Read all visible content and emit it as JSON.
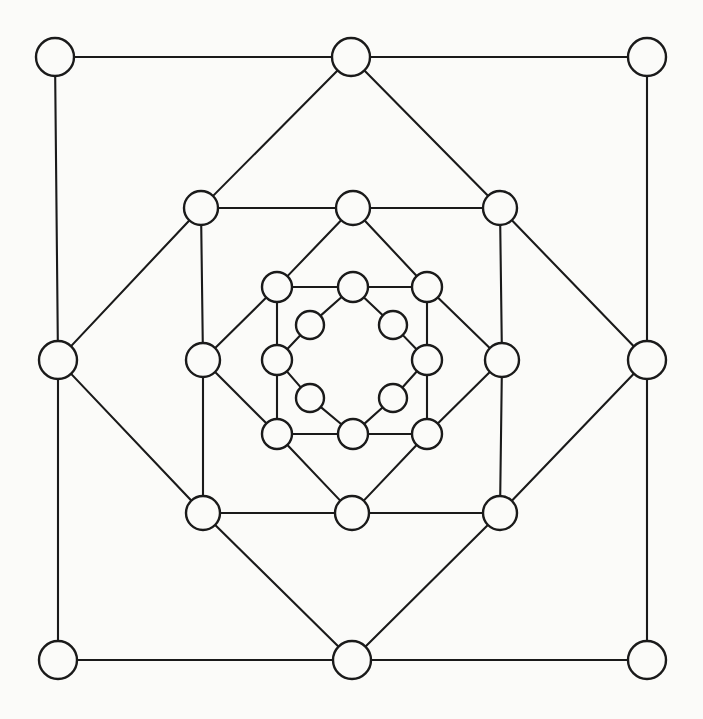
{
  "figure": {
    "kind": "node-link-diagram",
    "background_color": "#fbfbf9",
    "node_fill_color": "#fbfbf9",
    "node_stroke_color": "#1a1a1a",
    "edge_color": "#1a1a1a",
    "node_stroke_width": 2.4,
    "edge_stroke_width": 2.1,
    "node_count": 28,
    "edge_count": 48,
    "ring_count": 4,
    "width": 703,
    "height": 719
  },
  "chart_data": {
    "type": "graph",
    "xlabel": "",
    "ylabel": "",
    "nodes": [
      {
        "id": "r1-nw",
        "ring": 1,
        "role": "corner",
        "x": 55,
        "y": 57,
        "r": 19
      },
      {
        "id": "r1-n",
        "ring": 1,
        "role": "mid",
        "x": 351,
        "y": 57,
        "r": 19
      },
      {
        "id": "r1-ne",
        "ring": 1,
        "role": "corner",
        "x": 647,
        "y": 57,
        "r": 19
      },
      {
        "id": "r1-e",
        "ring": 1,
        "role": "mid",
        "x": 647,
        "y": 360,
        "r": 19
      },
      {
        "id": "r1-se",
        "ring": 1,
        "role": "corner",
        "x": 647,
        "y": 660,
        "r": 19
      },
      {
        "id": "r1-s",
        "ring": 1,
        "role": "mid",
        "x": 352,
        "y": 660,
        "r": 19
      },
      {
        "id": "r1-sw",
        "ring": 1,
        "role": "corner",
        "x": 58,
        "y": 660,
        "r": 19
      },
      {
        "id": "r1-w",
        "ring": 1,
        "role": "mid",
        "x": 58,
        "y": 360,
        "r": 19
      },
      {
        "id": "r2-nw",
        "ring": 2,
        "role": "corner",
        "x": 201,
        "y": 208,
        "r": 17
      },
      {
        "id": "r2-n",
        "ring": 2,
        "role": "mid",
        "x": 353,
        "y": 208,
        "r": 17
      },
      {
        "id": "r2-ne",
        "ring": 2,
        "role": "corner",
        "x": 500,
        "y": 208,
        "r": 17
      },
      {
        "id": "r2-e",
        "ring": 2,
        "role": "mid",
        "x": 502,
        "y": 360,
        "r": 17
      },
      {
        "id": "r2-se",
        "ring": 2,
        "role": "corner",
        "x": 500,
        "y": 513,
        "r": 17
      },
      {
        "id": "r2-s",
        "ring": 2,
        "role": "mid",
        "x": 352,
        "y": 513,
        "r": 17
      },
      {
        "id": "r2-sw",
        "ring": 2,
        "role": "corner",
        "x": 203,
        "y": 513,
        "r": 17
      },
      {
        "id": "r2-w",
        "ring": 2,
        "role": "mid",
        "x": 203,
        "y": 360,
        "r": 17
      },
      {
        "id": "r3-nw",
        "ring": 3,
        "role": "corner",
        "x": 277,
        "y": 287,
        "r": 15
      },
      {
        "id": "r3-n",
        "ring": 3,
        "role": "mid",
        "x": 353,
        "y": 287,
        "r": 15
      },
      {
        "id": "r3-ne",
        "ring": 3,
        "role": "corner",
        "x": 427,
        "y": 287,
        "r": 15
      },
      {
        "id": "r3-e",
        "ring": 3,
        "role": "mid",
        "x": 427,
        "y": 360,
        "r": 15
      },
      {
        "id": "r3-se",
        "ring": 3,
        "role": "corner",
        "x": 427,
        "y": 434,
        "r": 15
      },
      {
        "id": "r3-s",
        "ring": 3,
        "role": "mid",
        "x": 353,
        "y": 434,
        "r": 15
      },
      {
        "id": "r3-sw",
        "ring": 3,
        "role": "corner",
        "x": 277,
        "y": 434,
        "r": 15
      },
      {
        "id": "r3-w",
        "ring": 3,
        "role": "mid",
        "x": 277,
        "y": 360,
        "r": 15
      },
      {
        "id": "r4-nw",
        "ring": 4,
        "role": "corner",
        "x": 310,
        "y": 325,
        "r": 14
      },
      {
        "id": "r4-ne",
        "ring": 4,
        "role": "corner",
        "x": 393,
        "y": 325,
        "r": 14
      },
      {
        "id": "r4-se",
        "ring": 4,
        "role": "corner",
        "x": 393,
        "y": 398,
        "r": 14
      },
      {
        "id": "r4-sw",
        "ring": 4,
        "role": "corner",
        "x": 310,
        "y": 398,
        "r": 14
      }
    ],
    "edges": [
      [
        "r1-nw",
        "r1-n"
      ],
      [
        "r1-n",
        "r1-ne"
      ],
      [
        "r1-ne",
        "r1-e"
      ],
      [
        "r1-e",
        "r1-se"
      ],
      [
        "r1-se",
        "r1-s"
      ],
      [
        "r1-s",
        "r1-sw"
      ],
      [
        "r1-sw",
        "r1-w"
      ],
      [
        "r1-w",
        "r1-nw"
      ],
      [
        "r1-n",
        "r2-nw"
      ],
      [
        "r1-n",
        "r2-ne"
      ],
      [
        "r1-e",
        "r2-ne"
      ],
      [
        "r1-e",
        "r2-se"
      ],
      [
        "r1-s",
        "r2-se"
      ],
      [
        "r1-s",
        "r2-sw"
      ],
      [
        "r1-w",
        "r2-sw"
      ],
      [
        "r1-w",
        "r2-nw"
      ],
      [
        "r2-nw",
        "r2-n"
      ],
      [
        "r2-n",
        "r2-ne"
      ],
      [
        "r2-ne",
        "r2-e"
      ],
      [
        "r2-e",
        "r2-se"
      ],
      [
        "r2-se",
        "r2-s"
      ],
      [
        "r2-s",
        "r2-sw"
      ],
      [
        "r2-sw",
        "r2-w"
      ],
      [
        "r2-w",
        "r2-nw"
      ],
      [
        "r2-n",
        "r3-nw"
      ],
      [
        "r2-n",
        "r3-ne"
      ],
      [
        "r2-e",
        "r3-ne"
      ],
      [
        "r2-e",
        "r3-se"
      ],
      [
        "r2-s",
        "r3-se"
      ],
      [
        "r2-s",
        "r3-sw"
      ],
      [
        "r2-w",
        "r3-sw"
      ],
      [
        "r2-w",
        "r3-nw"
      ],
      [
        "r3-nw",
        "r3-n"
      ],
      [
        "r3-n",
        "r3-ne"
      ],
      [
        "r3-ne",
        "r3-e"
      ],
      [
        "r3-e",
        "r3-se"
      ],
      [
        "r3-se",
        "r3-s"
      ],
      [
        "r3-s",
        "r3-sw"
      ],
      [
        "r3-sw",
        "r3-w"
      ],
      [
        "r3-w",
        "r3-nw"
      ],
      [
        "r3-n",
        "r4-nw"
      ],
      [
        "r3-n",
        "r4-ne"
      ],
      [
        "r3-e",
        "r4-ne"
      ],
      [
        "r3-e",
        "r4-se"
      ],
      [
        "r3-s",
        "r4-se"
      ],
      [
        "r3-s",
        "r4-sw"
      ],
      [
        "r3-w",
        "r4-sw"
      ],
      [
        "r3-w",
        "r4-nw"
      ]
    ]
  }
}
